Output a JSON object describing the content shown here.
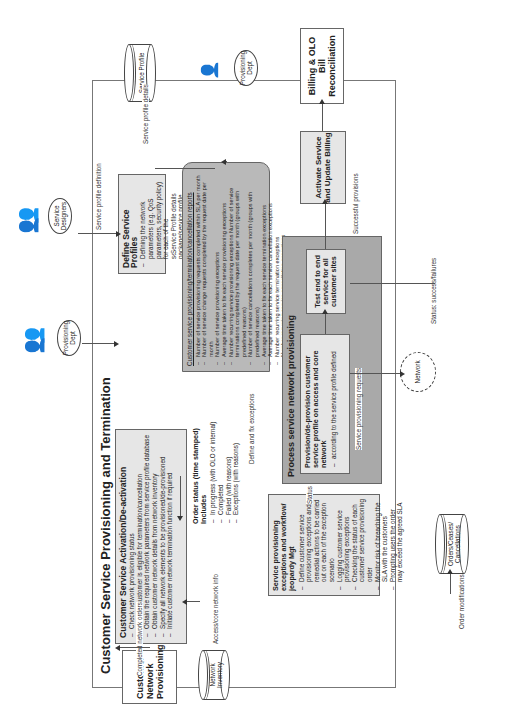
{
  "diagram": {
    "title": "Customer Service Provisioning and Termination",
    "orientation": "rotated 90° counter-clockwise",
    "actors": {
      "service_designers": "Service Designers",
      "provisioning_dept_top": "Provisioning Dept",
      "provisioning_dept_left": "Provisioning Dept"
    },
    "databases": {
      "service_profile": "Service Profile",
      "network_inventory": "Network Inventory",
      "orders": "Orders/Ceases/ Cancellations"
    },
    "cloud": {
      "network": "Network"
    },
    "external_boxes": {
      "customer_network_provisioning": "Customer Network Provisioning",
      "billing": "Billing & OLO Bill Reconciliation"
    },
    "define_profiles": {
      "title": "Define Service Profiles",
      "items": [
        "Defining the network parameters (e.g. QoS parameters, security policy) for each of the services/service package/service profile"
      ]
    },
    "activation": {
      "title": "Customer Service Activation/De-activation",
      "items": [
        "Check network provisioning status",
        "Check if customer is eligible for termination/cancellation",
        "Obtain the required network parameters  from service profile database",
        "Obtain customer network details from network inventory",
        "Specify all network elements to be provisioned/de-provisioned",
        "Initiate customer network termination function if required"
      ]
    },
    "order_status": {
      "title": "Order status (time stamped)",
      "subtitle": "Includes",
      "items": [
        "In progress (with OLO or internal)",
        "Completed",
        "Failed (with reasons)",
        "Exceptions (with reasons)"
      ]
    },
    "exceptions": {
      "title": "Service provisioning exceptions and workflow/ jeopardy Mgt",
      "items": [
        "Define customer service provisioning exceptions and remedial actions to be carried out on each of the exception scenario",
        "Logging customer service provisioning exceptions",
        "Checking the status of each customer service provisioning order",
        "Monitor risk of breaching the SLA with the customers",
        "Prompting users the order may exceed the agreed SLA"
      ]
    },
    "reports": {
      "title": "Customer service provisioning/termination/cancellation reports",
      "items": [
        "Number of service provisioning requests completed within SLA per month",
        "Number of service change requests completed by the request date per month",
        "Number of service provisioning exceptions",
        "Average time taken to fix each service provisioning exceptions",
        "Number recurring service provisioning exceptions Number of service terminations completed by the request date per month (groups with predefined reasons)",
        "Number of service cancellations completes per month (groups with predefined reasons)",
        "Average time taken to fix each service termination exceptions",
        "Average time taken to fix each service cancellation exceptions",
        "Number recurring service termination exceptions",
        "Number recurring service cancellation exceptions"
      ]
    },
    "process_network": {
      "title": "Process service network provisioning",
      "provision_box": {
        "title": "Provision/de-provision customer service profile on access and core network",
        "items": [
          "according to the service profile defined"
        ]
      },
      "test_box": "Test end to end service for all customer sites"
    },
    "activate": "Activate Service and Update Billing",
    "flow_labels": {
      "service_profile_definition": "Service profile definition",
      "service_profile_details_top": "Service profile details",
      "service_profile_details": "Service Profile details",
      "define_fix_exceptions": "Define and fix exceptions",
      "status": "Status",
      "service_provisioning_requests": "Service provisioning requests",
      "successful_provisions": "Successful provisions",
      "status_success_failures": "Status: success/failures",
      "completed_network_orders": "Completed network orders",
      "access_core_network_info": "Access/core network info",
      "order_modifications": "Order modifications"
    },
    "colors": {
      "box_light": "#e6e6e6",
      "box_medium": "#b9b9b9",
      "box_dark": "#a9a9a9",
      "line": "#555555"
    }
  }
}
